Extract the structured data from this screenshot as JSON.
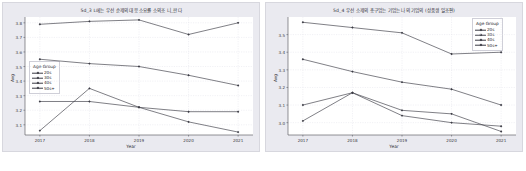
{
  "figures": [
    {
      "id": "left",
      "title": "5d_3 L에는 우선 순제의 대응 소요률 소의조 니_판다",
      "legend_title": "Age Group",
      "legend_position": "left-middle"
    },
    {
      "id": "right",
      "title": "5d_4 우선 소제의 총구업는 기업는 나의 기업의 (상품생 일조편)",
      "legend_title": "Age Group",
      "legend_position": "right-top"
    }
  ],
  "chart_data": [
    {
      "type": "line",
      "title": "5d_3 L에는 우선 순제의 대응 소요률 소의조 니_판다",
      "xlabel": "Year",
      "ylabel": "Avg",
      "categories": [
        "2017",
        "2018",
        "2019",
        "2020",
        "2021"
      ],
      "x": [
        2017,
        2018,
        2019,
        2020,
        2021
      ],
      "xlim": [
        2016.7,
        2021.3
      ],
      "ylim": [
        3.03,
        3.84
      ],
      "yticks": [
        3.1,
        3.2,
        3.3,
        3.4,
        3.5,
        3.6,
        3.7,
        3.8
      ],
      "grid": true,
      "legend": "Age Group",
      "legend_position": "center left",
      "series": [
        {
          "name": "20s",
          "values": [
            3.06,
            3.35,
            3.22,
            3.12,
            3.05
          ]
        },
        {
          "name": "30s",
          "values": [
            3.26,
            3.26,
            3.22,
            3.19,
            3.19
          ]
        },
        {
          "name": "40s",
          "values": [
            3.55,
            3.52,
            3.5,
            3.44,
            3.37
          ]
        },
        {
          "name": "50s+",
          "values": [
            3.79,
            3.81,
            3.82,
            3.72,
            3.8
          ]
        }
      ]
    },
    {
      "type": "line",
      "title": "5d_4 우선 소제의 총구업는 기업는 나의 기업의 (상품생 일조편)",
      "xlabel": "Year",
      "ylabel": "Avg",
      "categories": [
        "2017",
        "2018",
        "2019",
        "2020",
        "2021"
      ],
      "x": [
        2017,
        2018,
        2019,
        2020,
        2021
      ],
      "xlim": [
        2016.7,
        2021.3
      ],
      "ylim": [
        2.93,
        3.6
      ],
      "yticks": [
        3.0,
        3.1,
        3.2,
        3.3,
        3.4,
        3.5
      ],
      "grid": true,
      "legend": "Age Group",
      "legend_position": "upper right",
      "series": [
        {
          "name": "20s",
          "values": [
            3.01,
            3.17,
            3.04,
            3.0,
            2.98
          ]
        },
        {
          "name": "30s",
          "values": [
            3.1,
            3.17,
            3.07,
            3.05,
            2.95
          ]
        },
        {
          "name": "40s",
          "values": [
            3.36,
            3.29,
            3.23,
            3.19,
            3.1
          ]
        },
        {
          "name": "50s+",
          "values": [
            3.57,
            3.54,
            3.51,
            3.39,
            3.4
          ]
        }
      ]
    }
  ],
  "colors": {
    "line": "#3b3b44",
    "panel": "#ffffff",
    "figure_background": "#eaeaf0",
    "grid": "#e2e2ea",
    "text": "#33333a"
  }
}
